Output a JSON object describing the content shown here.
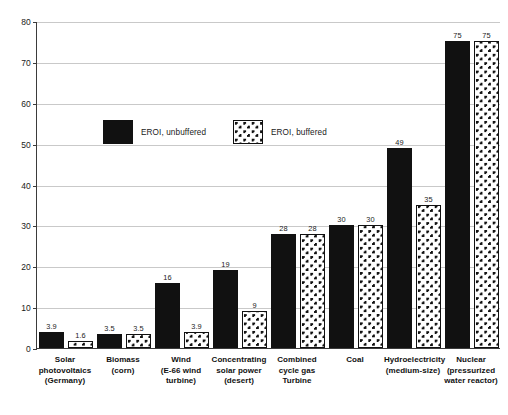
{
  "chart_data": {
    "type": "bar",
    "title": "",
    "xlabel": "",
    "ylabel": "",
    "ylim": [
      0,
      80
    ],
    "ytick_step": 10,
    "yticks": [
      0,
      10,
      20,
      30,
      40,
      50,
      60,
      70,
      80
    ],
    "grid": true,
    "legend_position": "upper-left-inside",
    "categories": [
      "Solar photovoltaics (Germany)",
      "Biomass (corn)",
      "Wind (E-66 wind turbine)",
      "Concentrating solar power (desert)",
      "Combined cycle gas Turbine",
      "Coal",
      "Hydroelectricity (medium-size)",
      "Nuclear (pressurized water reactor)"
    ],
    "category_lines": [
      [
        "Solar",
        "photovoltaics",
        "(Germany)"
      ],
      [
        "Biomass",
        "(corn)"
      ],
      [
        "Wind",
        "(E-66 wind",
        "turbine)"
      ],
      [
        "Concentrating",
        "solar power",
        "(desert)"
      ],
      [
        "Combined",
        "cycle gas",
        "Turbine"
      ],
      [
        "Coal"
      ],
      [
        "Hydroelectricity",
        "(medium-size)"
      ],
      [
        "Nuclear",
        "(pressurized",
        "water reactor)"
      ]
    ],
    "series": [
      {
        "name": "EROI, unbuffered",
        "style": "solid-black",
        "values": [
          3.9,
          3.5,
          16,
          19,
          28,
          30,
          49,
          75
        ],
        "value_labels": [
          "3.9",
          "3.5",
          "16",
          "19",
          "28",
          "30",
          "49",
          "75"
        ]
      },
      {
        "name": "EROI, buffered",
        "style": "dotted-pattern",
        "values": [
          1.6,
          3.5,
          3.9,
          9,
          28,
          30,
          35,
          75
        ],
        "value_labels": [
          "1.6",
          "3.5",
          "3.9",
          "9",
          "28",
          "30",
          "35",
          "75"
        ]
      }
    ]
  },
  "legend": {
    "items": [
      {
        "label": "EROI, unbuffered",
        "style": "unbuffered"
      },
      {
        "label": "EROI, buffered",
        "style": "buffered"
      }
    ]
  },
  "colors": {
    "series_unbuffered": "#111111",
    "series_buffered_fill": "#ffffff",
    "series_buffered_dots": "#111111",
    "axis": "#3b3b3b",
    "gridline": "#c9c9c9",
    "text": "#1a1a1a",
    "background": "#ffffff"
  }
}
